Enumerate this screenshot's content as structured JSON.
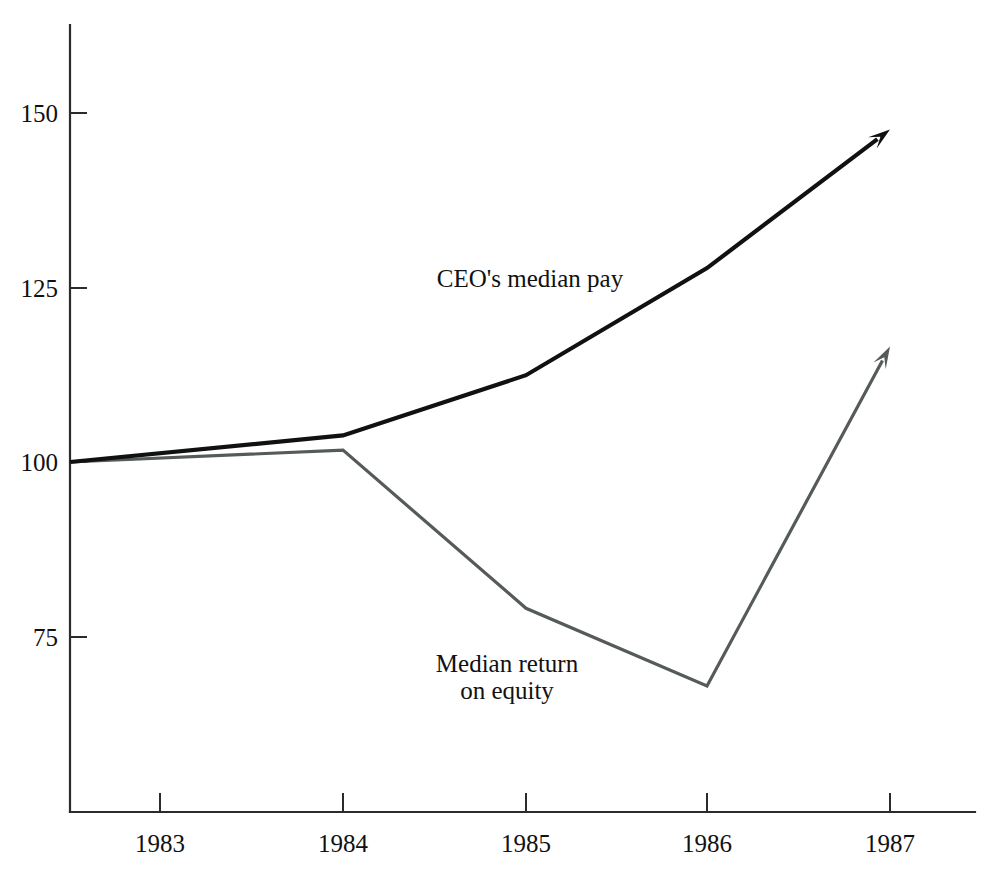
{
  "chart_data": {
    "type": "line",
    "title": "",
    "subtitle": "",
    "xlabel": "",
    "ylabel": "",
    "categories": [
      "1983",
      "1984",
      "1985",
      "1986",
      "1987"
    ],
    "x": [
      1983,
      1984,
      1985,
      1986,
      1987
    ],
    "xlim": [
      1982.6,
      1987.5
    ],
    "ylim": [
      55,
      157
    ],
    "y_ticks": [
      75,
      100,
      125,
      150
    ],
    "y_tick_labels": [
      "75",
      "100",
      "125",
      "150"
    ],
    "x_tick_labels": [
      "1983",
      "1984",
      "1985",
      "1986",
      "1987"
    ],
    "grid": false,
    "legend": "inline-annotations",
    "index_base": 100,
    "series": [
      {
        "name": "CEO's median pay",
        "color": "#111111",
        "values": [
          100,
          103.8,
          112.4,
          127.7,
          147.5
        ],
        "terminal": "arrow",
        "label_x": 1985.0,
        "label_y": 128.5
      },
      {
        "name": "Median return on equity",
        "color": "#555a5a",
        "values": [
          100,
          101.7,
          79.1,
          68.0,
          116.5
        ],
        "terminal": "arrow",
        "label_line_1": "Median return",
        "label_line_2": "on equity",
        "label_x": 1984.9,
        "label_y": 71.5
      }
    ],
    "annotations": [
      {
        "text": "CEO's median pay",
        "x": 1985.0,
        "y": 128.5
      },
      {
        "text": "Median return",
        "x": 1984.9,
        "y": 72.5
      },
      {
        "text": "on equity",
        "x": 1984.9,
        "y": 68.8
      }
    ]
  },
  "axes": {
    "y_axis_name": "value-axis",
    "x_axis_name": "year-axis"
  },
  "colors": {
    "background": "#ffffff",
    "axis": "#2b2b2b",
    "series_primary": "#111111",
    "series_secondary": "#555a5a",
    "text": "#111111"
  }
}
